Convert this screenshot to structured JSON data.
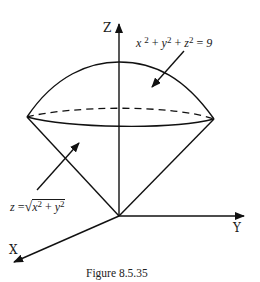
{
  "figure": {
    "caption": "Figure 8.5.35",
    "axes": {
      "z_label": "Z",
      "y_label": "Y",
      "x_label": "X"
    },
    "sphere_equation": {
      "x": "x",
      "y": "y",
      "z": "z",
      "exp": "2",
      "plus": "+",
      "equals": "=",
      "rhs": "9",
      "full_text": "x² + y² + z² = 9"
    },
    "cone_equation": {
      "lhs": "z",
      "equals": "=",
      "sqrt_symbol": "√",
      "x": "x",
      "y": "y",
      "exp": "2",
      "plus": "+",
      "full_text": "z = √(x² + y²)"
    },
    "colors": {
      "stroke": "#111111",
      "background": "#ffffff"
    }
  }
}
